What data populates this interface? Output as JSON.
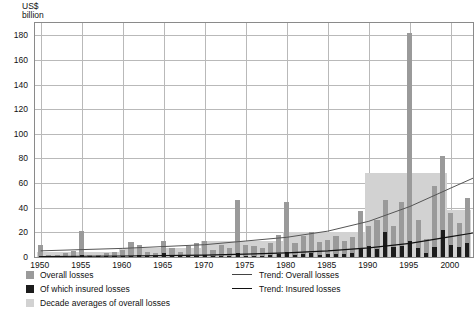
{
  "chart_data": {
    "type": "bar",
    "title": "",
    "ylabel": "US$ billion",
    "xlabel": "",
    "ylim": [
      0,
      190
    ],
    "yticks": [
      0,
      20,
      40,
      60,
      80,
      100,
      120,
      140,
      160,
      180
    ],
    "xticks": [
      1950,
      1955,
      1960,
      1965,
      1970,
      1975,
      1980,
      1985,
      1990,
      1995,
      2000
    ],
    "xlim": [
      1949.3,
      2002.7
    ],
    "grid": true,
    "legend_position": "below-plot",
    "x": [
      1950,
      1951,
      1952,
      1953,
      1954,
      1955,
      1956,
      1957,
      1958,
      1959,
      1960,
      1961,
      1962,
      1963,
      1964,
      1965,
      1966,
      1967,
      1968,
      1969,
      1970,
      1971,
      1972,
      1973,
      1974,
      1975,
      1976,
      1977,
      1978,
      1979,
      1980,
      1981,
      1982,
      1983,
      1984,
      1985,
      1986,
      1987,
      1988,
      1989,
      1990,
      1991,
      1992,
      1993,
      1994,
      1995,
      1996,
      1997,
      1998,
      1999,
      2000,
      2001,
      2002
    ],
    "series": [
      {
        "name": "Overall losses",
        "color": "#9a9a9a",
        "values": [
          10,
          2,
          2,
          3,
          5,
          21,
          2,
          2,
          3,
          4,
          6,
          12,
          10,
          4,
          3,
          13,
          7,
          4,
          9,
          11,
          13,
          6,
          10,
          7,
          46,
          10,
          9,
          7,
          11,
          18,
          45,
          11,
          17,
          20,
          12,
          14,
          17,
          13,
          16,
          37,
          25,
          30,
          46,
          25,
          45,
          182,
          30,
          15,
          58,
          82,
          36,
          28,
          48
        ]
      },
      {
        "name": "Of which insured losses",
        "color": "#1c1c1c",
        "values": [
          0.5,
          0.2,
          0.2,
          0.3,
          0.5,
          1.5,
          0.2,
          0.2,
          0.3,
          0.4,
          0.6,
          1.0,
          1.5,
          0.4,
          0.3,
          3.0,
          0.8,
          0.5,
          1.0,
          1.2,
          1.5,
          0.8,
          1.2,
          0.8,
          3.0,
          1.2,
          1.0,
          0.8,
          1.5,
          2.5,
          4.0,
          1.5,
          2.5,
          3.0,
          1.8,
          2.2,
          2.8,
          2.2,
          3.0,
          7.0,
          9.0,
          6.5,
          20.0,
          8.5,
          9.0,
          13.0,
          7.0,
          3.5,
          8.0,
          22.0,
          9.5,
          8.0,
          11.0
        ]
      }
    ],
    "decade_averages": [
      {
        "label": "1950s",
        "start": 1950,
        "end": 1959,
        "value": 4.0
      },
      {
        "label": "1960s",
        "start": 1960,
        "end": 1969,
        "value": 7.0
      },
      {
        "label": "1970s",
        "start": 1970,
        "end": 1979,
        "value": 13.0
      },
      {
        "label": "1980s",
        "start": 1980,
        "end": 1989,
        "value": 20.0
      },
      {
        "label": "1990s",
        "start": 1990,
        "end": 1999,
        "value": 68.0
      },
      {
        "label": "2000s",
        "start": 2000,
        "end": 2002,
        "value": 38.0
      }
    ],
    "trend_overall": {
      "name": "Trend: Overall losses",
      "color": "#555555",
      "x": [
        1950,
        1960,
        1970,
        1975,
        1980,
        1985,
        1990,
        1995,
        2000,
        2002.7
      ],
      "y": [
        5,
        7,
        10,
        13,
        16,
        21,
        29,
        41,
        56,
        64
      ]
    },
    "trend_insured": {
      "name": "Trend: Insured losses",
      "color": "#111111",
      "x": [
        1950,
        1960,
        1970,
        1975,
        1980,
        1985,
        1990,
        1995,
        2000,
        2002.7
      ],
      "y": [
        0.4,
        0.8,
        1.6,
        2.4,
        3.4,
        5.0,
        7.4,
        11.0,
        16.5,
        19.5
      ]
    }
  },
  "legend": {
    "overall": "Overall losses",
    "insured": "Of which insured losses",
    "decade": "Decade averages of overall losses",
    "trend_overall": "Trend: Overall losses",
    "trend_insured": "Trend: Insured losses"
  }
}
